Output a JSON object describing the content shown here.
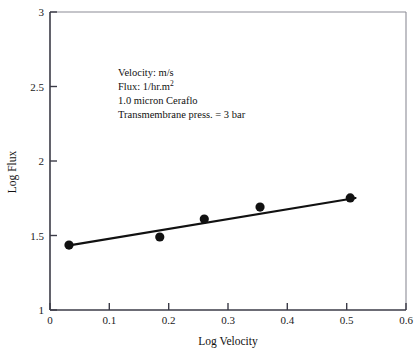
{
  "chart_data": {
    "type": "scatter",
    "title": "",
    "xlabel": "Log Velocity",
    "ylabel": "Log Flux",
    "xlim": [
      0,
      0.6
    ],
    "ylim": [
      1,
      3
    ],
    "grid": false,
    "legend": "none",
    "xticks": [
      "0",
      "0.1",
      "0.2",
      "0.3",
      "0.4",
      "0.5",
      "0.6"
    ],
    "xtick_values": [
      0,
      0.1,
      0.2,
      0.3,
      0.4,
      0.5,
      0.6
    ],
    "yticks": [
      "1",
      "1.5",
      "2",
      "2.5",
      "3"
    ],
    "ytick_values": [
      1,
      1.5,
      2,
      2.5,
      3
    ],
    "x": [
      0.032,
      0.185,
      0.26,
      0.354,
      0.506
    ],
    "values": [
      1.436,
      1.49,
      1.61,
      1.691,
      1.752
    ],
    "series": [
      {
        "name": "Log Flux vs Log Velocity",
        "marker": "filled-circle",
        "color": "#111111",
        "points": [
          {
            "x": 0.032,
            "y": 1.436
          },
          {
            "x": 0.185,
            "y": 1.49
          },
          {
            "x": 0.26,
            "y": 1.61
          },
          {
            "x": 0.354,
            "y": 1.691
          },
          {
            "x": 0.506,
            "y": 1.752
          }
        ]
      }
    ],
    "fit_line": {
      "name": "linear fit",
      "color": "#111111",
      "x_start": 0.03,
      "y_start": 1.432,
      "x_end": 0.515,
      "y_end": 1.752,
      "slope": 0.66,
      "intercept": 1.412
    },
    "annotations": [
      {
        "line": "Velocity: m/s"
      },
      {
        "line": "Flux: 1/hr.m",
        "superscript": "2"
      },
      {
        "line": "1.0 micron Ceraflo"
      },
      {
        "line": "Transmembrane press. = 3 bar"
      }
    ]
  },
  "annotation_block": {
    "line1": "Velocity: m/s",
    "line2_base": "Flux: 1/hr.m",
    "line2_sup": "2",
    "line3": "1.0 micron Ceraflo",
    "line4": "Transmembrane press. = 3 bar"
  },
  "axes": {
    "x_title": "Log Velocity",
    "y_title": "Log Flux"
  },
  "colors": {
    "marker": "#111111",
    "fit_line": "#111111",
    "axis": "#3b3b47",
    "frame": "#8c8c96",
    "background": "#ffffff",
    "text": "#111111"
  }
}
